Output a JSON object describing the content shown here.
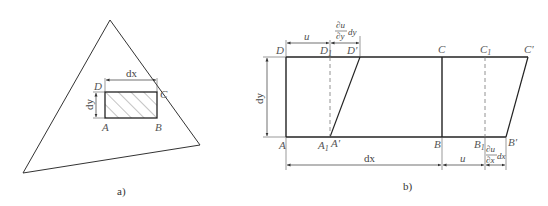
{
  "panel_a": {
    "caption": "a)",
    "labels": {
      "A": "A",
      "B": "B",
      "C": "C",
      "D": "D",
      "dx": "dx",
      "dy": "dy"
    }
  },
  "panel_b": {
    "caption": "b)",
    "labels": {
      "A": "A",
      "A1": "A",
      "A1_sub": "1",
      "A_prime": "A′",
      "B": "B",
      "B1": "B",
      "B1_sub": "1",
      "B_prime": "B′",
      "C": "C",
      "C1": "C",
      "C1_sub": "1",
      "C_prime": "C′",
      "D": "D",
      "D1": "D",
      "D1_sub": "1",
      "D_prime": "D′",
      "u_top": "u",
      "u_bottom": "u",
      "dx": "dx",
      "dy": "dy",
      "du_dy_num": "∂u",
      "du_dy_den": "∂y",
      "du_dy_suffix": "dy",
      "du_dx_num": "∂u",
      "du_dx_den": "∂x",
      "du_dx_suffix": "dx"
    }
  }
}
